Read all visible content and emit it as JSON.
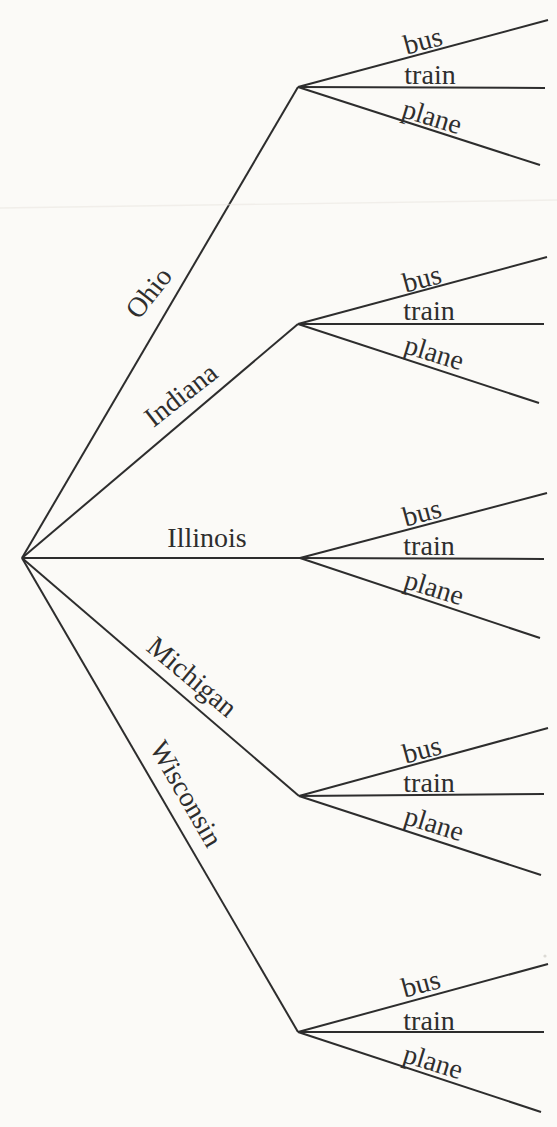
{
  "diagram": {
    "type": "tree-diagram",
    "line_color": "#2d2d2d",
    "text_color": "#2e2e2e",
    "background_color": "#fbfaf7"
  },
  "tree": {
    "states": [
      {
        "label": "Ohio",
        "modes": [
          {
            "label": "bus"
          },
          {
            "label": "train"
          },
          {
            "label": "plane"
          }
        ]
      },
      {
        "label": "Indiana",
        "modes": [
          {
            "label": "bus"
          },
          {
            "label": "train"
          },
          {
            "label": "plane"
          }
        ]
      },
      {
        "label": "Illinois",
        "modes": [
          {
            "label": "bus"
          },
          {
            "label": "train"
          },
          {
            "label": "plane"
          }
        ]
      },
      {
        "label": "Michigan",
        "modes": [
          {
            "label": "bus"
          },
          {
            "label": "train"
          },
          {
            "label": "plane"
          }
        ]
      },
      {
        "label": "Wisconsin",
        "modes": [
          {
            "label": "bus"
          },
          {
            "label": "train"
          },
          {
            "label": "plane"
          }
        ]
      }
    ]
  }
}
